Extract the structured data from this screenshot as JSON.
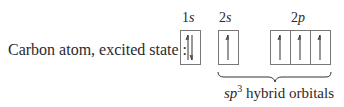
{
  "diagram": {
    "label": "Carbon atom, excited state :",
    "orbitals": [
      {
        "name": "1s",
        "num": "1",
        "letter": "s",
        "electrons": [
          "up",
          "down"
        ]
      },
      {
        "name": "2s",
        "num": "2",
        "letter": "s",
        "electrons": [
          "up"
        ]
      },
      {
        "name": "2p",
        "num": "2",
        "letter": "p",
        "electrons": [
          "up",
          "up",
          "up"
        ]
      }
    ],
    "brace_label": {
      "prefix": "sp",
      "superscript": "3",
      "suffix": " hybrid orbitals"
    }
  }
}
